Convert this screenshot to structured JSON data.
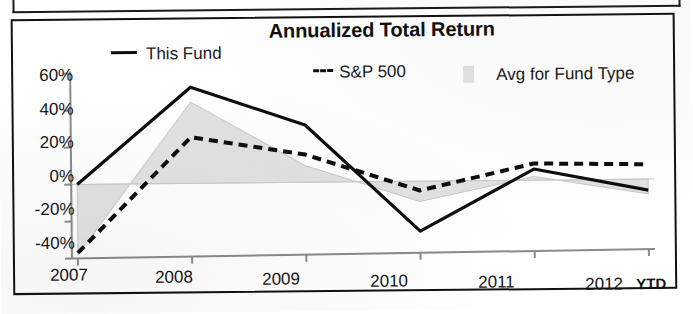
{
  "chart_data": {
    "type": "line",
    "title": "Annualized Total Return",
    "xlabel": "",
    "ylabel": "",
    "categories": [
      "2007",
      "2008",
      "2009",
      "2010",
      "2011",
      "2012"
    ],
    "x_axis_suffix": "YTD",
    "ylim": [
      -40,
      60
    ],
    "ytick_labels": [
      "60%",
      "40%",
      "20%",
      "0%",
      "-20%",
      "-40%"
    ],
    "ytick_values": [
      60,
      40,
      20,
      0,
      -20,
      -40
    ],
    "grid": false,
    "legend_position": "top",
    "series": [
      {
        "name": "This Fund",
        "style": "solid-line",
        "color": "#0e0e0e",
        "values": [
          0,
          52,
          31,
          -27,
          6,
          -6
        ]
      },
      {
        "name": "S&P 500",
        "style": "dashed-line",
        "color": "#0e0e0e",
        "values": [
          -37,
          25,
          15,
          -5,
          9,
          8
        ]
      },
      {
        "name": "Avg for Fund Type",
        "style": "filled-area",
        "color": "#e2e2e2",
        "values": [
          -38,
          44,
          9,
          -11,
          2,
          -8
        ]
      }
    ]
  },
  "legend": {
    "this_fund": "This Fund",
    "sp500": "S&P 500",
    "avg_fund_type": "Avg for Fund Type"
  },
  "axes": {
    "y_ticks": [
      "60%",
      "40%",
      "20%",
      "0%",
      "-20%",
      "-40%"
    ],
    "x_ticks": [
      "2007",
      "2008",
      "2009",
      "2010",
      "2011",
      "2012"
    ],
    "x_suffix": "YTD"
  },
  "colors": {
    "line": "#0e0e0e",
    "area_fill": "#e2e2e2",
    "axis": "#8a8a8a",
    "frame": "#121212",
    "text": "#141414"
  }
}
